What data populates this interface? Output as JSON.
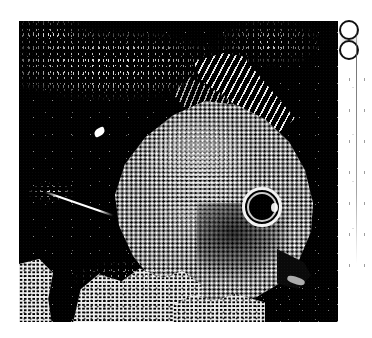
{
  "page": {
    "width": 372,
    "height": 338,
    "background_color": "#ffffff"
  },
  "photo": {
    "caption": "Underwater photograph of a butterflyfish beside coral",
    "rendering": "1-bit dithered halftone (black and white)",
    "ink_color": "#000000",
    "paper_color": "#ffffff",
    "frame": {
      "x": 19,
      "y": 21,
      "width": 319,
      "height": 301
    },
    "subjects": {
      "fish": {
        "name": "butterflyfish",
        "orientation": "facing right",
        "parts": {
          "body": "disc-shaped scaled body",
          "dorsal_fin": "striped dorsal fin rays",
          "eye": "dark pupil with bright ring",
          "snout": "pointed dark snout",
          "lip": "pale lip"
        }
      },
      "background": "dark water with bright speckled debris",
      "foreground": "bright coral and rock along the bottom edge",
      "debris": {
        "leaf": "small bright leaf-shaped fleck",
        "streak": "thin diagonal bright streak at left"
      }
    }
  },
  "margin_strip": {
    "label": "right margin of page",
    "background_color": "#ffffff",
    "marks": [
      {
        "name": "ring-mark-upper",
        "shape": "ring",
        "color": "#111111"
      },
      {
        "name": "ring-mark-lower",
        "shape": "ring",
        "color": "#111111"
      }
    ],
    "rule": {
      "name": "vertical-rule",
      "color": "#5a5a5a"
    },
    "speckles": "scattered grey scan flecks"
  }
}
